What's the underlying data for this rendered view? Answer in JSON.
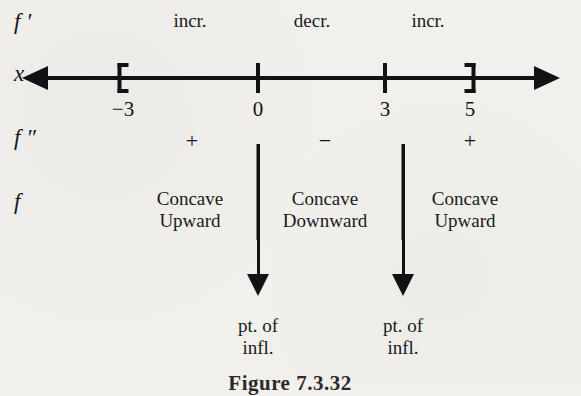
{
  "figure": {
    "caption": "Figure 7.3.32"
  },
  "rows": {
    "fprime_label": "f ′",
    "x_label": "x",
    "fdoubleprime_label": "f ″",
    "f_label": "f"
  },
  "axis": {
    "ticks": [
      {
        "label": "−3",
        "x": 123,
        "style": "bracket-open"
      },
      {
        "label": "0",
        "x": 258,
        "style": "tick"
      },
      {
        "label": "3",
        "x": 385,
        "style": "tick"
      },
      {
        "label": "5",
        "x": 470,
        "style": "bracket-close"
      }
    ],
    "left_arrow": "left-arrowhead",
    "right_arrow": "right-arrowhead"
  },
  "fprime_intervals": [
    {
      "text": "incr.",
      "x": 190
    },
    {
      "text": "decr.",
      "x": 312
    },
    {
      "text": "incr.",
      "x": 428
    }
  ],
  "fdoubleprime_signs": [
    {
      "text": "+",
      "x": 192
    },
    {
      "text": "−",
      "x": 325
    },
    {
      "text": "+",
      "x": 470
    }
  ],
  "concavity": [
    {
      "line1": "Concave",
      "line2": "Upward",
      "x": 190
    },
    {
      "line1": "Concave",
      "line2": "Downward",
      "x": 325
    },
    {
      "line1": "Concave",
      "line2": "Upward",
      "x": 465
    }
  ],
  "dividers": [
    {
      "x": 258
    },
    {
      "x": 403
    }
  ],
  "inflection_points": [
    {
      "line1": "pt. of",
      "line2": "infl.",
      "x": 258
    },
    {
      "line1": "pt. of",
      "line2": "infl.",
      "x": 403
    }
  ],
  "colors": {
    "ink": "#121214",
    "paper": "#f1f0ec"
  }
}
